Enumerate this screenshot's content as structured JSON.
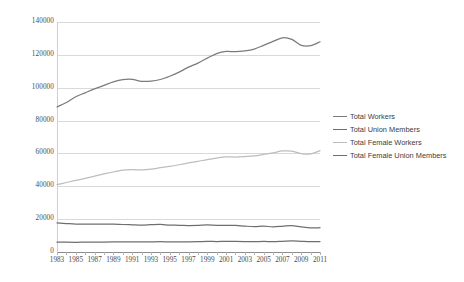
{
  "chart_data": {
    "type": "line",
    "title": "",
    "xlabel": "",
    "ylabel": "",
    "ylim": [
      0,
      140000
    ],
    "ytick_values": [
      0,
      20000,
      40000,
      60000,
      80000,
      100000,
      120000,
      140000
    ],
    "ytick_labels": [
      "0",
      "20000",
      "40000",
      "60000",
      "80000",
      "100000",
      "120000",
      "140000"
    ],
    "grid": true,
    "legend_position": "right",
    "x": [
      1983,
      1984,
      1985,
      1986,
      1987,
      1988,
      1989,
      1990,
      1991,
      1992,
      1993,
      1994,
      1995,
      1996,
      1997,
      1998,
      1999,
      2000,
      2001,
      2002,
      2003,
      2004,
      2005,
      2006,
      2007,
      2008,
      2009,
      2010,
      2011
    ],
    "xtick_labels": [
      "1983",
      "1985",
      "1987",
      "1989",
      "1991",
      "1993",
      "1995",
      "1997",
      "1999",
      "2001",
      "2003",
      "2005",
      "2007",
      "2009",
      "2011"
    ],
    "xtick_values": [
      1983,
      1985,
      1987,
      1989,
      1991,
      1993,
      1995,
      1997,
      1999,
      2001,
      2003,
      2005,
      2007,
      2009,
      2011
    ],
    "series": [
      {
        "name": "Total Workers",
        "color": "#7b7b7b",
        "values": [
          88290,
          91000,
          94500,
          96900,
          99300,
          101400,
          103500,
          104900,
          105100,
          103900,
          104000,
          105000,
          107000,
          109500,
          112500,
          115000,
          118000,
          120800,
          122100,
          121900,
          122400,
          123500,
          125800,
          128200,
          130400,
          129400,
          125800,
          125600,
          128000
        ]
      },
      {
        "name": "Total Union Members",
        "color": "#6f6f6f",
        "values": [
          17717,
          17340,
          16996,
          16975,
          16913,
          17002,
          16960,
          16740,
          16568,
          16390,
          16598,
          16748,
          16360,
          16269,
          16110,
          16211,
          16477,
          16258,
          16275,
          16145,
          15776,
          15472,
          15685,
          15359,
          15670,
          16098,
          15327,
          14715,
          14764
        ]
      },
      {
        "name": "Total Female Workers",
        "color": "#bdbdbd",
        "values": [
          41000,
          42300,
          43600,
          44800,
          46200,
          47500,
          48700,
          49800,
          50100,
          50000,
          50400,
          51300,
          52100,
          53100,
          54200,
          55200,
          56300,
          57200,
          57900,
          57800,
          58100,
          58500,
          59400,
          60400,
          61500,
          61400,
          59900,
          59700,
          61700
        ]
      },
      {
        "name": "Total Female Union Members",
        "color": "#6f6f6f",
        "values": [
          6000,
          5960,
          5910,
          5960,
          6000,
          6080,
          6140,
          6150,
          6140,
          6100,
          6180,
          6260,
          6180,
          6200,
          6190,
          6260,
          6430,
          6380,
          6430,
          6420,
          6330,
          6290,
          6400,
          6330,
          6500,
          6700,
          6460,
          6260,
          6330
        ]
      }
    ]
  },
  "legend": {
    "items": [
      {
        "label": "Total Workers"
      },
      {
        "label": "Total Union Members"
      },
      {
        "label": "Total Female Workers"
      },
      {
        "label": "Total Female Union Members"
      }
    ]
  }
}
